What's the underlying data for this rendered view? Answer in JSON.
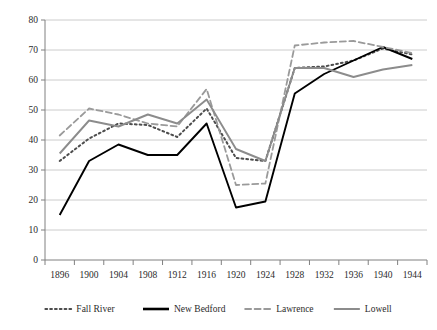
{
  "chart_data": {
    "type": "line",
    "title": "",
    "subtitle": "",
    "xlabel": "",
    "ylabel": "",
    "ylim": [
      0,
      80
    ],
    "ytick_step": 10,
    "yticks": [
      "0",
      "10",
      "20",
      "30",
      "40",
      "50",
      "60",
      "70",
      "80"
    ],
    "grid": true,
    "grid_axis": "y",
    "legend_position": "bottom",
    "categories": [
      "1896",
      "1900",
      "1904",
      "1908",
      "1912",
      "1916",
      "1920",
      "1924",
      "1928",
      "1932",
      "1936",
      "1940",
      "1944"
    ],
    "x": [
      1896,
      1900,
      1904,
      1908,
      1912,
      1916,
      1920,
      1924,
      1928,
      1932,
      1936,
      1940,
      1944
    ],
    "series": [
      {
        "name": "Fall River",
        "style": "dotted",
        "color": "#4d4d4d",
        "values": [
          33.0,
          40.5,
          45.5,
          45.0,
          41.0,
          50.5,
          34.0,
          33.0,
          64.0,
          64.5,
          66.5,
          70.5,
          68.5
        ]
      },
      {
        "name": "New Bedford",
        "style": "solid",
        "color": "#000000",
        "values": [
          15.0,
          33.0,
          38.5,
          35.0,
          35.0,
          45.5,
          17.5,
          19.5,
          55.5,
          62.0,
          66.5,
          71.0,
          67.0
        ]
      },
      {
        "name": "Lawrence",
        "style": "dashed",
        "color": "#9a9a9a",
        "values": [
          41.5,
          50.5,
          48.5,
          45.5,
          44.5,
          57.0,
          25.0,
          25.5,
          71.5,
          72.5,
          73.0,
          71.0,
          69.0
        ]
      },
      {
        "name": "Lowell",
        "style": "solid",
        "color": "#8c8c8c",
        "values": [
          35.5,
          46.5,
          44.5,
          48.5,
          45.5,
          53.5,
          37.0,
          33.0,
          64.0,
          64.0,
          61.0,
          63.5,
          65.0
        ]
      }
    ]
  },
  "legend": {
    "items": [
      {
        "label": "Fall River",
        "style": "dotted",
        "color": "#4d4d4d"
      },
      {
        "label": "New Bedford",
        "style": "solid",
        "color": "#000000"
      },
      {
        "label": "Lawrence",
        "style": "dashed",
        "color": "#9a9a9a"
      },
      {
        "label": "Lowell",
        "style": "solid",
        "color": "#8c8c8c"
      }
    ]
  },
  "axes": {
    "plot_left": 45,
    "plot_right": 427,
    "plot_top": 20,
    "plot_bottom": 260,
    "gridline_color": "#bfbfbf",
    "axis_color": "#808080"
  }
}
